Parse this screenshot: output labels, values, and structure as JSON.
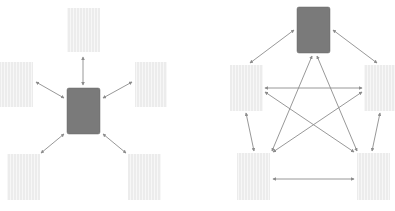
{
  "colors": {
    "background": "#ffffff",
    "hub_fill": "#7a7a7a",
    "hub_stroke": "#6a6a6a",
    "node_fill": "#ececec",
    "node_stripe": "#f7f7f7",
    "edge": "#8c8c8c"
  },
  "diagrams": [
    {
      "name": "star-topology",
      "nodes": [
        {
          "id": "hub",
          "type": "hub",
          "x": 67,
          "y": 88,
          "w": 33,
          "h": 46
        },
        {
          "id": "top",
          "type": "node",
          "x": 67,
          "y": 8,
          "w": 33,
          "h": 44
        },
        {
          "id": "left",
          "type": "node",
          "x": 0,
          "y": 62,
          "w": 33,
          "h": 45
        },
        {
          "id": "right",
          "type": "node",
          "x": 135,
          "y": 62,
          "w": 32,
          "h": 45
        },
        {
          "id": "bottom-left",
          "type": "node",
          "x": 7,
          "y": 154,
          "w": 33,
          "h": 46
        },
        {
          "id": "bottom-right",
          "type": "node",
          "x": 128,
          "y": 154,
          "w": 33,
          "h": 46
        }
      ],
      "edges": [
        {
          "x1": 83,
          "y1": 57,
          "x2": 83,
          "y2": 85
        },
        {
          "x1": 36,
          "y1": 82,
          "x2": 64,
          "y2": 98
        },
        {
          "x1": 132,
          "y1": 82,
          "x2": 103,
          "y2": 98
        },
        {
          "x1": 64,
          "y1": 134,
          "x2": 41,
          "y2": 153
        },
        {
          "x1": 103,
          "y1": 134,
          "x2": 126,
          "y2": 153
        }
      ]
    },
    {
      "name": "mesh-topology",
      "nodes": [
        {
          "id": "hub",
          "type": "hub",
          "x": 297,
          "y": 7,
          "w": 33,
          "h": 46
        },
        {
          "id": "mid-left",
          "type": "node",
          "x": 230,
          "y": 65,
          "w": 33,
          "h": 46
        },
        {
          "id": "mid-right",
          "type": "node",
          "x": 364,
          "y": 65,
          "w": 31,
          "h": 46
        },
        {
          "id": "bottom-left",
          "type": "node",
          "x": 237,
          "y": 153,
          "w": 33,
          "h": 47
        },
        {
          "id": "bottom-right",
          "type": "node",
          "x": 357,
          "y": 153,
          "w": 33,
          "h": 47
        }
      ],
      "edges": [
        {
          "x1": 294,
          "y1": 30,
          "x2": 250,
          "y2": 63
        },
        {
          "x1": 333,
          "y1": 30,
          "x2": 377,
          "y2": 63
        },
        {
          "x1": 265,
          "y1": 88,
          "x2": 362,
          "y2": 88
        },
        {
          "x1": 265,
          "y1": 92,
          "x2": 354,
          "y2": 152
        },
        {
          "x1": 362,
          "y1": 92,
          "x2": 273,
          "y2": 152
        },
        {
          "x1": 312,
          "y1": 56,
          "x2": 272,
          "y2": 151
        },
        {
          "x1": 317,
          "y1": 56,
          "x2": 357,
          "y2": 151
        },
        {
          "x1": 246,
          "y1": 113,
          "x2": 254,
          "y2": 151
        },
        {
          "x1": 380,
          "y1": 113,
          "x2": 372,
          "y2": 151
        },
        {
          "x1": 273,
          "y1": 179,
          "x2": 354,
          "y2": 179
        }
      ]
    }
  ]
}
